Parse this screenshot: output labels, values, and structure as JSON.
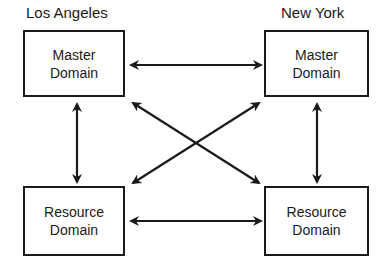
{
  "diagram": {
    "cities": [
      {
        "label": "Los Angeles"
      },
      {
        "label": "New York"
      }
    ],
    "nodes": [
      {
        "id": "la-master",
        "line1": "Master",
        "line2": "Domain"
      },
      {
        "id": "ny-master",
        "line1": "Master",
        "line2": "Domain"
      },
      {
        "id": "la-resource",
        "line1": "Resource",
        "line2": "Domain"
      },
      {
        "id": "ny-resource",
        "line1": "Resource",
        "line2": "Domain"
      }
    ],
    "edges": [
      {
        "from": "la-master",
        "to": "ny-master",
        "type": "bidirectional"
      },
      {
        "from": "la-resource",
        "to": "ny-resource",
        "type": "bidirectional"
      },
      {
        "from": "la-master",
        "to": "la-resource",
        "type": "bidirectional"
      },
      {
        "from": "ny-master",
        "to": "ny-resource",
        "type": "bidirectional"
      },
      {
        "from": "la-master",
        "to": "ny-resource",
        "type": "bidirectional"
      },
      {
        "from": "ny-master",
        "to": "la-resource",
        "type": "bidirectional"
      }
    ]
  }
}
